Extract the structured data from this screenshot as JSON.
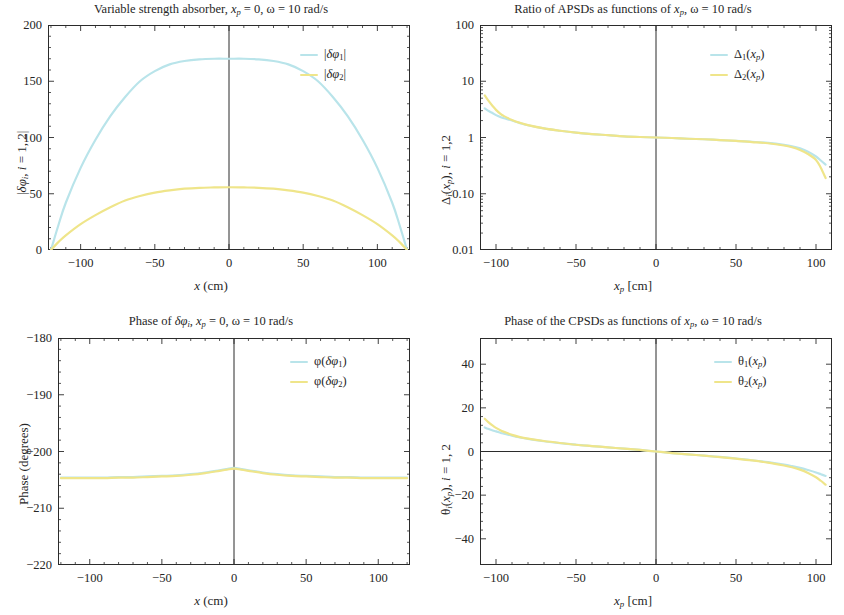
{
  "figure": {
    "width": 844,
    "height": 615,
    "background": "#ffffff",
    "colors": {
      "series1": "#b9e4ea",
      "series2": "#efe58a",
      "axis": "#2b2b2b",
      "text": "#262626"
    }
  },
  "chart_data": [
    {
      "id": "top-left",
      "type": "line",
      "title": "Variable strength absorber, x_p = 0, ω = 10 rad/s",
      "title_parts": {
        "prefix": "Variable strength absorber, ",
        "sym_x": "x",
        "sub_p": "p",
        "eq0": " = 0, ",
        "omega": "ω",
        "eq10": " = 10 rad/s"
      },
      "xlabel": "x (cm)",
      "ylabel": "|δφi, i = 1, 2|",
      "xlim": [
        -122,
        122
      ],
      "ylim": [
        0,
        200
      ],
      "xticks": [
        -100,
        -50,
        0,
        100
      ],
      "xticklabels": [
        "-100",
        "-50",
        "0",
        "50",
        "100"
      ],
      "xticks_all": [
        -100,
        -50,
        0,
        50,
        100
      ],
      "yticks": [
        0,
        50,
        100,
        150,
        200
      ],
      "yticklabels": [
        "0",
        "50",
        "100",
        "150",
        "200"
      ],
      "grid": false,
      "legend_position": "upper right",
      "zero_line_x": 0,
      "series": [
        {
          "name": "|δφ1|",
          "color": "#b9e4ea",
          "x": [
            -120,
            -115,
            -110,
            -100,
            -90,
            -80,
            -70,
            -60,
            -50,
            -40,
            -30,
            -20,
            -10,
            0,
            10,
            20,
            30,
            40,
            50,
            60,
            70,
            80,
            90,
            100,
            110,
            115,
            120
          ],
          "y": [
            0,
            22,
            42,
            73,
            98,
            119,
            136,
            150,
            159,
            165,
            168,
            169.5,
            170,
            170,
            170,
            169.5,
            168,
            165,
            159,
            150,
            136,
            119,
            98,
            73,
            42,
            22,
            0
          ]
        },
        {
          "name": "|δφ2|",
          "color": "#efe58a",
          "x": [
            -120,
            -115,
            -110,
            -100,
            -90,
            -80,
            -70,
            -60,
            -50,
            -40,
            -30,
            -20,
            -10,
            0,
            10,
            20,
            30,
            40,
            50,
            60,
            70,
            80,
            90,
            100,
            110,
            115,
            120
          ],
          "y": [
            0,
            7,
            13,
            23,
            31,
            38,
            44,
            48,
            51,
            53,
            54.5,
            55.3,
            55.6,
            55.8,
            55.6,
            55.3,
            54.5,
            53,
            51,
            48,
            44,
            38,
            31,
            23,
            13,
            7,
            0
          ]
        }
      ]
    },
    {
      "id": "top-right",
      "type": "line",
      "title": "Ratio of APSDs as functions of x_p, ω = 10 rad/s",
      "title_parts": {
        "prefix": "Ratio of APSDs as functions of ",
        "sym_x": "x",
        "sub_p": "p",
        "eq0": ", ",
        "omega": "ω",
        "eq10": " = 10 rad/s"
      },
      "xlabel": "x_p [cm]",
      "ylabel": "Δi(x_p), i = 1,2",
      "xlim": [
        -110,
        110
      ],
      "ylim": [
        0.01,
        100
      ],
      "yscale": "log",
      "xticks_all": [
        -100,
        -50,
        0,
        50,
        100
      ],
      "xticklabels": [
        "-100",
        "-50",
        "0",
        "50",
        "100"
      ],
      "yticks": [
        0.01,
        0.1,
        1,
        10,
        100
      ],
      "yticklabels": [
        "0.01",
        "0.10",
        "1",
        "10",
        "100"
      ],
      "grid": false,
      "legend_position": "upper right",
      "zero_line_x": 0,
      "series": [
        {
          "name": "Δ1(x_p)",
          "color": "#b9e4ea",
          "x": [
            -107,
            -105,
            -102,
            -100,
            -97,
            -95,
            -90,
            -85,
            -80,
            -70,
            -60,
            -50,
            -40,
            -30,
            -20,
            -10,
            0,
            10,
            20,
            30,
            40,
            50,
            60,
            70,
            80,
            85,
            90,
            95,
            100,
            103,
            106
          ],
          "y": [
            3.3,
            3.0,
            2.7,
            2.5,
            2.3,
            2.2,
            2.0,
            1.8,
            1.65,
            1.45,
            1.32,
            1.22,
            1.15,
            1.1,
            1.05,
            1.02,
            1.0,
            0.98,
            0.95,
            0.93,
            0.9,
            0.87,
            0.84,
            0.8,
            0.74,
            0.7,
            0.64,
            0.56,
            0.46,
            0.39,
            0.33
          ]
        },
        {
          "name": "Δ2(x_p)",
          "color": "#efe58a",
          "x": [
            -107,
            -105,
            -102,
            -100,
            -97,
            -95,
            -90,
            -85,
            -80,
            -70,
            -60,
            -50,
            -40,
            -30,
            -20,
            -10,
            0,
            10,
            20,
            30,
            40,
            50,
            60,
            70,
            80,
            85,
            90,
            95,
            100,
            103,
            106
          ],
          "y": [
            5.6,
            4.6,
            3.6,
            3.1,
            2.6,
            2.4,
            2.05,
            1.82,
            1.66,
            1.45,
            1.32,
            1.22,
            1.15,
            1.1,
            1.05,
            1.02,
            1.0,
            0.98,
            0.95,
            0.93,
            0.9,
            0.87,
            0.83,
            0.79,
            0.72,
            0.67,
            0.6,
            0.51,
            0.4,
            0.29,
            0.19
          ]
        }
      ]
    },
    {
      "id": "bottom-left",
      "type": "line",
      "title": "Phase of δφi, x_p = 0, ω = 10 rad/s",
      "title_parts": {
        "prefix": "Phase of ",
        "delta_phi": "δφ",
        "sub_i": "i",
        "mid": ", ",
        "sym_x": "x",
        "sub_p": "p",
        "eq0": " = 0, ",
        "omega": "ω",
        "eq10": " = 10 rad/s"
      },
      "xlabel": "x (cm)",
      "ylabel": "Phase (degrees)",
      "xlim": [
        -122,
        122
      ],
      "ylim": [
        -220,
        -180
      ],
      "xticks_all": [
        -100,
        -50,
        0,
        50,
        100
      ],
      "xticklabels": [
        "-100",
        "-50",
        "0",
        "50",
        "100"
      ],
      "yticks": [
        -220,
        -210,
        -200,
        -190,
        -180
      ],
      "yticklabels": [
        "-220",
        "-210",
        "-200",
        "-190",
        "-180"
      ],
      "grid": false,
      "legend_position": "upper right",
      "zero_line_x": 0,
      "series": [
        {
          "name": "φ(δφ1)",
          "color": "#b9e4ea",
          "x": [
            -120,
            -110,
            -100,
            -90,
            -80,
            -70,
            -60,
            -50,
            -40,
            -30,
            -20,
            -10,
            -5,
            0,
            5,
            10,
            20,
            30,
            40,
            50,
            60,
            70,
            80,
            90,
            100,
            110,
            120
          ],
          "y": [
            -204.6,
            -204.6,
            -204.6,
            -204.6,
            -204.5,
            -204.5,
            -204.4,
            -204.3,
            -204.2,
            -204.0,
            -203.7,
            -203.3,
            -203.1,
            -202.9,
            -203.1,
            -203.3,
            -203.7,
            -204.0,
            -204.2,
            -204.3,
            -204.4,
            -204.5,
            -204.5,
            -204.6,
            -204.6,
            -204.6,
            -204.6
          ]
        },
        {
          "name": "φ(δφ2)",
          "color": "#efe58a",
          "x": [
            -120,
            -110,
            -100,
            -90,
            -80,
            -70,
            -60,
            -50,
            -40,
            -30,
            -20,
            -10,
            -5,
            0,
            5,
            10,
            20,
            30,
            40,
            50,
            60,
            70,
            80,
            90,
            100,
            110,
            120
          ],
          "y": [
            -204.7,
            -204.7,
            -204.7,
            -204.7,
            -204.6,
            -204.6,
            -204.5,
            -204.4,
            -204.3,
            -204.1,
            -203.8,
            -203.4,
            -203.2,
            -203.0,
            -203.2,
            -203.4,
            -203.8,
            -204.1,
            -204.3,
            -204.4,
            -204.5,
            -204.6,
            -204.6,
            -204.7,
            -204.7,
            -204.7,
            -204.7
          ]
        }
      ]
    },
    {
      "id": "bottom-right",
      "type": "line",
      "title": "Phase of the CPSDs as functions of x_p, ω = 10 rad/s",
      "title_parts": {
        "prefix": "Phase of the CPSDs as functions of ",
        "sym_x": "x",
        "sub_p": "p",
        "eq0": ", ",
        "omega": "ω",
        "eq10": " = 10 rad/s"
      },
      "xlabel": "x_p [cm]",
      "ylabel": "θi(x_p), i = 1, 2",
      "xlim": [
        -110,
        110
      ],
      "ylim": [
        -52,
        52
      ],
      "xticks_all": [
        -100,
        -50,
        0,
        50,
        100
      ],
      "xticklabels": [
        "-100",
        "-50",
        "0",
        "50",
        "100"
      ],
      "yticks": [
        -40,
        -20,
        0,
        20,
        40
      ],
      "yticklabels": [
        "-40",
        "-20",
        "0",
        "20",
        "40"
      ],
      "grid": false,
      "legend_position": "upper right",
      "zero_line_x": 0,
      "zero_line_y": 0,
      "series": [
        {
          "name": "θ1(x_p)",
          "color": "#b9e4ea",
          "x": [
            -107,
            -105,
            -102,
            -100,
            -97,
            -95,
            -90,
            -85,
            -80,
            -70,
            -60,
            -50,
            -40,
            -30,
            -20,
            -10,
            0,
            10,
            20,
            30,
            40,
            50,
            60,
            70,
            80,
            85,
            90,
            95,
            100,
            103,
            106
          ],
          "y": [
            11.0,
            10.4,
            9.6,
            9.2,
            8.5,
            8.2,
            7.2,
            6.4,
            5.8,
            4.7,
            3.8,
            3.1,
            2.5,
            1.9,
            1.3,
            0.7,
            0.0,
            -0.7,
            -1.3,
            -1.9,
            -2.5,
            -3.2,
            -4.0,
            -4.9,
            -6.0,
            -6.7,
            -7.5,
            -8.5,
            -9.6,
            -10.4,
            -11.2
          ]
        },
        {
          "name": "θ2(x_p)",
          "color": "#efe58a",
          "x": [
            -107,
            -105,
            -102,
            -100,
            -97,
            -95,
            -90,
            -85,
            -80,
            -70,
            -60,
            -50,
            -40,
            -30,
            -20,
            -10,
            0,
            10,
            20,
            30,
            40,
            50,
            60,
            70,
            80,
            85,
            90,
            95,
            100,
            103,
            106
          ],
          "y": [
            15.0,
            13.6,
            11.8,
            10.8,
            9.6,
            9.0,
            7.6,
            6.6,
            5.9,
            4.8,
            3.9,
            3.1,
            2.5,
            1.9,
            1.3,
            0.7,
            0.0,
            -0.7,
            -1.3,
            -1.9,
            -2.6,
            -3.3,
            -4.1,
            -5.1,
            -6.4,
            -7.2,
            -8.3,
            -9.8,
            -11.8,
            -13.4,
            -15.2
          ]
        }
      ]
    }
  ]
}
